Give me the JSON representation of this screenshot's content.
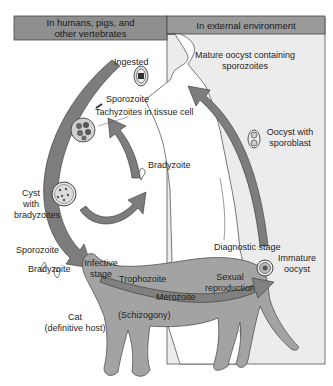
{
  "headers": {
    "left_line1": "In humans, pigs, and",
    "left_line2": "other vertebrates",
    "right": "In external environment"
  },
  "labels": {
    "ingested": "Ingested",
    "mature_oocyst_line1": "Mature oocyst containing",
    "mature_oocyst_line2": "sporozoites",
    "sporozoite_top": "Sporozoite",
    "tachyzoites": "Tachyzoites in tissue cell",
    "oocyst_sporoblast_line1": "Oocyst with",
    "oocyst_sporoblast_line2": "sporoblast",
    "bradyzoite_mid": "Bradyzoite",
    "cyst_line1": "Cyst",
    "cyst_line2": "with",
    "cyst_line3": "bradyzoites",
    "sporozoite_left": "Sporozoite",
    "bradyzoite_left": "Bradyzoite",
    "diagnostic_stage": "Diagnostic stage",
    "immature_oocyst_line1": "Immature",
    "immature_oocyst_line2": "oocyst",
    "infective_line1": "Infective",
    "infective_line2": "stage",
    "trophozoite": "Trophozoite",
    "sexual_line1": "Sexual",
    "sexual_line2": "reproduction",
    "merozoite": "Merozoite",
    "schizogony": "(Schizogony)",
    "cat_line1": "Cat",
    "cat_line2": "(definitive host)"
  },
  "colors": {
    "header_fill": "#8f8f8f",
    "env_panel": "#ececec",
    "cat_fill": "#a3a3a3",
    "arrow_fill": "#7d7d7d",
    "outline": "#333333"
  }
}
